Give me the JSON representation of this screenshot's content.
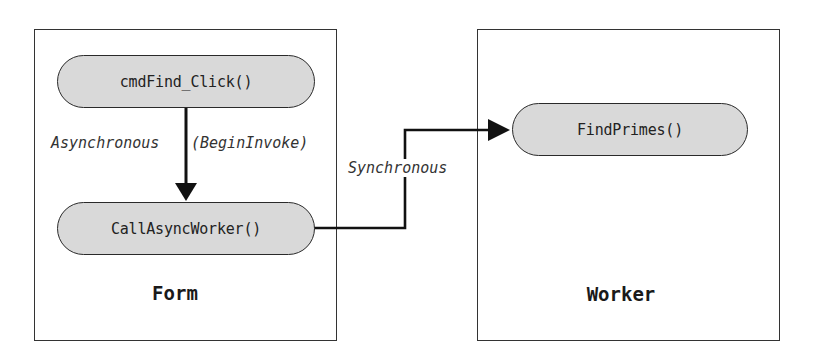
{
  "diagram": {
    "type": "flow",
    "boxes": [
      {
        "id": "form",
        "label": "Form",
        "nodes": [
          {
            "id": "cmdFind_Click",
            "label": "cmdFind_Click()"
          },
          {
            "id": "CallAsyncWorker",
            "label": "CallAsyncWorker()"
          }
        ]
      },
      {
        "id": "worker",
        "label": "Worker",
        "nodes": [
          {
            "id": "FindPrimes",
            "label": "FindPrimes()"
          }
        ]
      }
    ],
    "edges": [
      {
        "from": "cmdFind_Click",
        "to": "CallAsyncWorker",
        "label_left": "Asynchronous",
        "label_right": "(BeginInvoke)"
      },
      {
        "from": "CallAsyncWorker",
        "to": "FindPrimes",
        "label": "Synchronous"
      }
    ]
  },
  "colors": {
    "node_fill": "#d9d9d9",
    "stroke": "#1a1a1a",
    "background": "#ffffff"
  }
}
